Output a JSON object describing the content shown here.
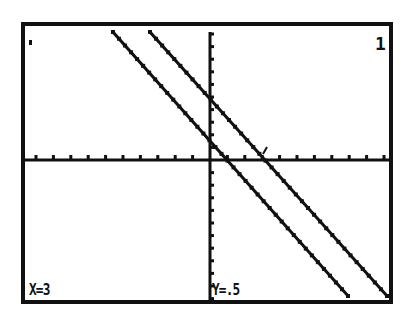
{
  "calculator_screen": {
    "type": "graph",
    "equation_index": "1",
    "trace_readout": {
      "x_label": "X=3",
      "y_label": "Y=.5"
    },
    "colors": {
      "background": "#ffffff",
      "ink": "#111111"
    },
    "frame": {
      "left": 23,
      "top": 24,
      "right": 391,
      "bottom": 302
    },
    "axes": {
      "x_axis_y": 160,
      "y_axis_x": 210,
      "x_tick_spacing": 17.4,
      "y_tick_spacing": 12.6
    },
    "graphs": [
      {
        "name": "line-1",
        "from": [
          113,
          32
        ],
        "to": [
          348,
          296
        ]
      },
      {
        "name": "line-2",
        "from": [
          150,
          32
        ],
        "to": [
          387,
          296
        ]
      }
    ],
    "cursor": {
      "x": 263,
      "y": 150
    }
  }
}
